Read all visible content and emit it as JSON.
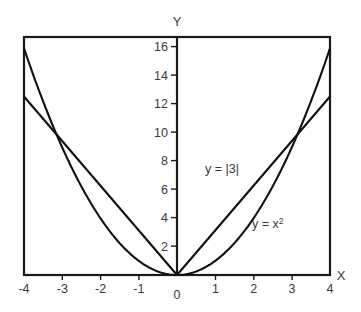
{
  "chart_data": {
    "type": "line",
    "title": "",
    "xlabel": "X",
    "ylabel": "Y",
    "xlim": [
      -4,
      4
    ],
    "ylim": [
      0,
      16.8
    ],
    "grid": false,
    "legend_position": "inline-annotation",
    "x_ticks": [
      "-4",
      "-3",
      "-2",
      "-1",
      "0",
      "1",
      "2",
      "3",
      "4"
    ],
    "x_tick_values": [
      -4,
      -3,
      -2,
      -1,
      0,
      1,
      2,
      3,
      4
    ],
    "y_ticks": [
      "2",
      "4",
      "6",
      "8",
      "10",
      "12",
      "14",
      "16"
    ],
    "y_tick_values": [
      2,
      4,
      6,
      8,
      10,
      12,
      14,
      16
    ],
    "origin_label": "0",
    "series": [
      {
        "name": "y = |3|",
        "kind": "v-shape",
        "slope": 3.15,
        "x": [
          -4,
          -3,
          -2,
          -1,
          0,
          1,
          2,
          3,
          4
        ],
        "values": [
          12.6,
          9.45,
          6.3,
          3.15,
          0,
          3.15,
          6.3,
          9.45,
          12.6
        ]
      },
      {
        "name": "y = x2",
        "kind": "parabola",
        "x": [
          -4,
          -3.5,
          -3,
          -2.5,
          -2,
          -1.5,
          -1,
          -0.5,
          0,
          0.5,
          1,
          1.5,
          2,
          2.5,
          3,
          3.5,
          4
        ],
        "values": [
          16,
          12.25,
          9,
          6.25,
          4,
          2.25,
          1,
          0.25,
          0,
          0.25,
          1,
          2.25,
          4,
          6.25,
          9,
          12.25,
          16
        ]
      }
    ],
    "annotations": [
      {
        "text_prefix": "y = |3|",
        "text_sup": "",
        "x": 1.1,
        "y": 7.6
      },
      {
        "text_prefix": "y = x",
        "text_sup": "2",
        "x": 2.05,
        "y": 4.2
      }
    ],
    "colors": {
      "curve": "#111111",
      "axis": "#1a1a1a",
      "text": "#3a3a3a",
      "background": "#ffffff"
    }
  }
}
